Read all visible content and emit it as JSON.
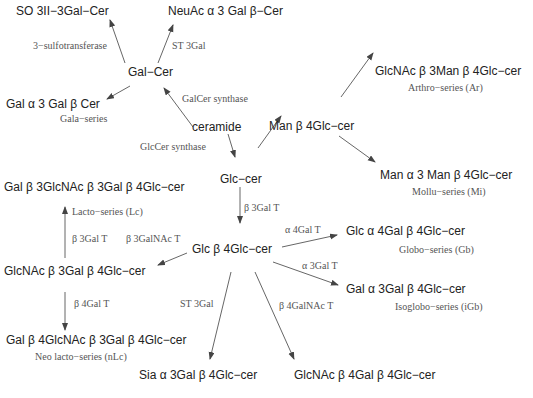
{
  "nodes": {
    "so3": "SO 3II−3Gal−Cer",
    "neuac": "NeuAc α 3 Gal β−Cer",
    "galcer": "Gal−Cer",
    "gala": "Gal α 3 Gal β Cer",
    "ceramide": "ceramide",
    "man_b4glc": "Man β 4Glc−cer",
    "glcnac_man": "GlcNAc β 3Man β 4Glc−cer",
    "man_a3man": "Man α 3 Man β 4Glc−cer",
    "glccer": "Glc−cer",
    "lacto": "Gal β 3GlcNAc β 3Gal β 4Glc−cer",
    "glc_b4glc": "Glc β 4Glc−cer",
    "glcnac_b3gal": "GlcNAc β 3Gal β 4Glc−cer",
    "globo": "Glc α 4Gal β 4Glc−cer",
    "isoglobo": "Gal α 3Gal β 4Glc−cer",
    "neolacto": "Gal β 4GlcNAc β 3Gal β 4Glc−cer",
    "sia": "Sia α 3Gal β 4Glc−cer",
    "glcnac_b4gal": "GlcNAc β 4Gal β 4Glc−cer"
  },
  "enzymes": {
    "sulfo": "3−sulfotransferase",
    "st3gal_top": "ST 3Gal",
    "galcer_synthase": "GalCer synthase",
    "glccer_synthase": "GlcCer synthase",
    "b3galt_main": "β 3Gal T",
    "a4galt": "α 4Gal T",
    "a3galt": "α 3Gal T",
    "b3galt_left": "β 3Gal T",
    "b3galnact": "β 3GalNAc T",
    "b4galt": "β 4Gal T",
    "st3gal_bottom": "ST 3Gal",
    "b4galnact": "β 4GalNAc T"
  },
  "series": {
    "gala": "Gala−series",
    "arthro": "Arthro−series (Ar)",
    "mollu": "Mollu−series (Mi)",
    "lacto": "Lacto−series (Lc)",
    "globo": "Globo−series (Gb)",
    "isoglobo": "Isoglobo−series (iGb)",
    "neolacto": "Neo lacto−series (nLc)"
  },
  "colors": {
    "node_text": "#222222",
    "label_text": "#555555",
    "arrow": "#444444"
  }
}
